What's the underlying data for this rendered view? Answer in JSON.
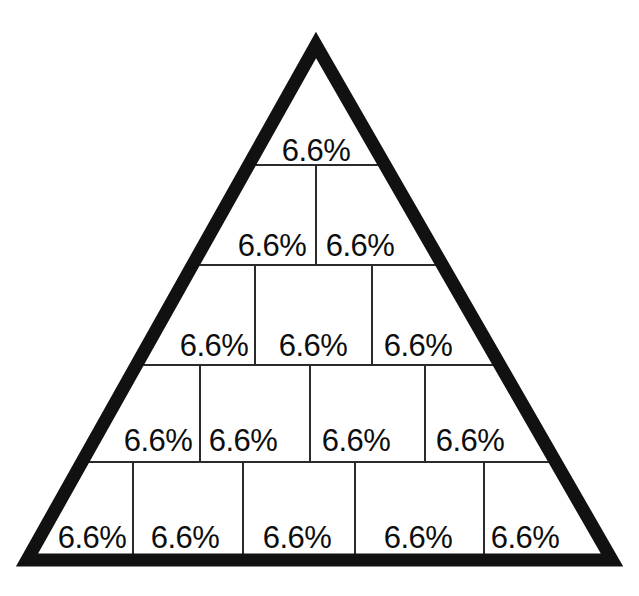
{
  "figure": {
    "name": "pyramid-percentage-diagram",
    "background_color": "#ffffff",
    "outline_color": "#111111",
    "divider_color": "#2b2b2b",
    "text_color": "#0d0d0d",
    "outline_width_px": 13,
    "divider_width_px": 2
  },
  "triangle": {
    "apex_x": 316,
    "apex_y": 45,
    "bottom_left_x": 27,
    "bottom_left_y": 560,
    "bottom_right_x": 612,
    "bottom_right_y": 560
  },
  "chart_data": {
    "type": "pie",
    "title": "",
    "subtitle": "",
    "xlabel": "",
    "ylabel": "",
    "legend_position": "none",
    "grid": false,
    "shape": "triangle-pyramid",
    "total_segments": 15,
    "segment_value": 6.6,
    "value_unit": "%",
    "rows": [
      {
        "index": 1,
        "top_y": 45,
        "bottom_y": 165,
        "cell_count": 1,
        "dividers_x": [],
        "label_y": 150,
        "cells": [
          {
            "label": "6.6%",
            "value": 6.6,
            "center_x": 316
          }
        ]
      },
      {
        "index": 2,
        "top_y": 165,
        "bottom_y": 265,
        "cell_count": 2,
        "dividers_x": [
          316
        ],
        "label_y": 245,
        "cells": [
          {
            "label": "6.6%",
            "value": 6.6,
            "center_x": 272
          },
          {
            "label": "6.6%",
            "value": 6.6,
            "center_x": 360
          }
        ]
      },
      {
        "index": 3,
        "top_y": 265,
        "bottom_y": 365,
        "cell_count": 3,
        "dividers_x": [
          255,
          372
        ],
        "label_y": 345,
        "cells": [
          {
            "label": "6.6%",
            "value": 6.6,
            "center_x": 214
          },
          {
            "label": "6.6%",
            "value": 6.6,
            "center_x": 313
          },
          {
            "label": "6.6%",
            "value": 6.6,
            "center_x": 418
          }
        ]
      },
      {
        "index": 4,
        "top_y": 365,
        "bottom_y": 462,
        "cell_count": 4,
        "dividers_x": [
          200,
          310,
          425
        ],
        "label_y": 440,
        "cells": [
          {
            "label": "6.6%",
            "value": 6.6,
            "center_x": 158
          },
          {
            "label": "6.6%",
            "value": 6.6,
            "center_x": 243
          },
          {
            "label": "6.6%",
            "value": 6.6,
            "center_x": 356
          },
          {
            "label": "6.6%",
            "value": 6.6,
            "center_x": 470
          }
        ]
      },
      {
        "index": 5,
        "top_y": 462,
        "bottom_y": 560,
        "cell_count": 5,
        "dividers_x": [
          133,
          243,
          355,
          484
        ],
        "label_y": 537,
        "cells": [
          {
            "label": "6.6%",
            "value": 6.6,
            "center_x": 92
          },
          {
            "label": "6.6%",
            "value": 6.6,
            "center_x": 185
          },
          {
            "label": "6.6%",
            "value": 6.6,
            "center_x": 297
          },
          {
            "label": "6.6%",
            "value": 6.6,
            "center_x": 418
          },
          {
            "label": "6.6%",
            "value": 6.6,
            "center_x": 525
          }
        ]
      }
    ]
  }
}
